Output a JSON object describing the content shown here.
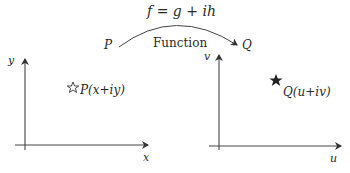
{
  "mapping": {
    "formula": "f = g + ih",
    "label": "Function",
    "from": "P",
    "to": "Q"
  },
  "z_plane": {
    "x_axis_label": "x",
    "y_axis_label": "y",
    "point_label": "P(x+iy)",
    "point_marker": "star-outline"
  },
  "w_plane": {
    "x_axis_label": "u",
    "y_axis_label": "v",
    "point_label": "Q(u+iv)",
    "point_marker": "star-filled"
  },
  "colors": {
    "stroke": "#333333",
    "text": "#2a2a2a"
  }
}
